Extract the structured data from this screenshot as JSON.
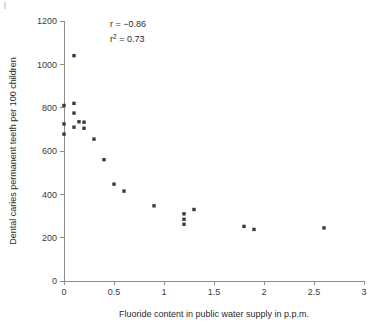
{
  "figure": {
    "background": "#ffffff",
    "marker_color": "#3b3b3b",
    "axis_color": "#8d8d8d"
  },
  "annotations": {
    "correlation_label": "r = −0.86",
    "r_squared_base": "r",
    "r_squared_exponent": "2",
    "r_squared_value": " = 0.73"
  },
  "chart_data": {
    "type": "scatter",
    "title": "",
    "xlabel": "Fluoride content in public water supply in p.p.m.",
    "ylabel": "Dental caries permanent teeth per 100 children",
    "xlim": [
      0,
      3
    ],
    "ylim": [
      0,
      1200
    ],
    "xticks": [
      0,
      0.5,
      1,
      1.5,
      2,
      2.5,
      3
    ],
    "xticklabels": [
      "0",
      "0.5",
      "1",
      "1.5",
      "2",
      "2.5",
      "3"
    ],
    "yticks": [
      0,
      200,
      400,
      600,
      800,
      1000,
      1200
    ],
    "yticklabels": [
      "0",
      "200",
      "400",
      "600",
      "800",
      "1000",
      "1200"
    ],
    "grid": false,
    "legend": null,
    "annotations": [
      "r = −0.86",
      "r² = 0.73"
    ],
    "statistics": {
      "r": -0.86,
      "r_squared": 0.73
    },
    "x": [
      0.0,
      0.0,
      0.0,
      0.1,
      0.1,
      0.1,
      0.1,
      0.15,
      0.2,
      0.2,
      0.3,
      0.4,
      0.5,
      0.6,
      0.9,
      1.2,
      1.2,
      1.2,
      1.3,
      1.8,
      1.9,
      2.6
    ],
    "y": [
      810,
      725,
      678,
      1040,
      820,
      775,
      710,
      735,
      733,
      705,
      655,
      560,
      447,
      415,
      347,
      310,
      285,
      262,
      330,
      252,
      238,
      245
    ],
    "points": [
      {
        "x": 0.0,
        "y": 810
      },
      {
        "x": 0.0,
        "y": 725
      },
      {
        "x": 0.0,
        "y": 678
      },
      {
        "x": 0.1,
        "y": 1040
      },
      {
        "x": 0.1,
        "y": 820
      },
      {
        "x": 0.1,
        "y": 775
      },
      {
        "x": 0.1,
        "y": 710
      },
      {
        "x": 0.15,
        "y": 735
      },
      {
        "x": 0.2,
        "y": 733
      },
      {
        "x": 0.2,
        "y": 705
      },
      {
        "x": 0.3,
        "y": 655
      },
      {
        "x": 0.4,
        "y": 560
      },
      {
        "x": 0.5,
        "y": 447
      },
      {
        "x": 0.6,
        "y": 415
      },
      {
        "x": 0.9,
        "y": 347
      },
      {
        "x": 1.2,
        "y": 310
      },
      {
        "x": 1.2,
        "y": 285
      },
      {
        "x": 1.2,
        "y": 262
      },
      {
        "x": 1.3,
        "y": 330
      },
      {
        "x": 1.8,
        "y": 252
      },
      {
        "x": 1.9,
        "y": 238
      },
      {
        "x": 2.6,
        "y": 245
      }
    ]
  }
}
